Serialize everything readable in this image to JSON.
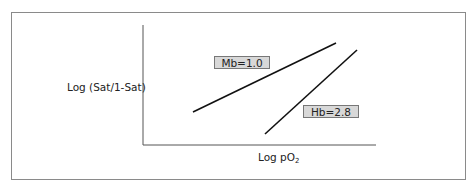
{
  "diagram": {
    "y_axis_label": "Log (Sat/1-Sat)",
    "x_axis_label": "Log pO",
    "x_axis_label_sub": "2",
    "lines": [
      {
        "name": "Mb",
        "label": "Mb=1.0",
        "slope": 1.0,
        "x1": 193,
        "y1": 112,
        "x2": 336,
        "y2": 43
      },
      {
        "name": "Hb",
        "label": "Hb=2.8",
        "slope": 2.8,
        "x1": 265,
        "y1": 134,
        "x2": 357,
        "y2": 50
      }
    ],
    "colors": {
      "line": "#111111",
      "axis": "#555555",
      "box_fill": "#d8d8d8",
      "border": "#8a8a8a"
    }
  }
}
